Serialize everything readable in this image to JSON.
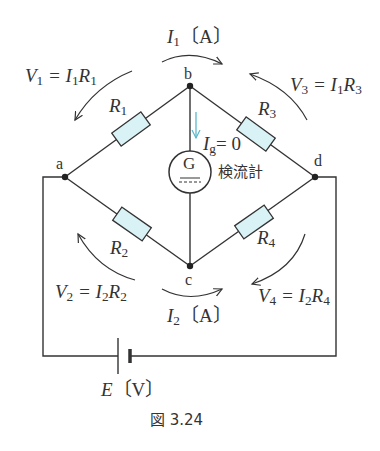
{
  "figure": {
    "caption": "図 3.24",
    "type": "Wheatstone bridge circuit"
  },
  "nodes": {
    "a": "a",
    "b": "b",
    "c": "c",
    "d": "d"
  },
  "resistors": [
    {
      "name": "R",
      "sub": "1"
    },
    {
      "name": "R",
      "sub": "2"
    },
    {
      "name": "R",
      "sub": "3"
    },
    {
      "name": "R",
      "sub": "4"
    }
  ],
  "currents": {
    "top": {
      "sym": "I",
      "sub": "1",
      "unit": "〔A〕"
    },
    "bottom": {
      "sym": "I",
      "sub": "2",
      "unit": "〔A〕"
    },
    "galvanometer": {
      "sym": "I",
      "sub": "g",
      "eq": "= 0"
    }
  },
  "voltages": [
    {
      "v": "V",
      "vs": "1",
      "i": "I",
      "is": "1",
      "r": "R",
      "rs": "1"
    },
    {
      "v": "V",
      "vs": "2",
      "i": "I",
      "is": "2",
      "r": "R",
      "rs": "2"
    },
    {
      "v": "V",
      "vs": "3",
      "i": "I",
      "is": "1",
      "r": "R",
      "rs": "3"
    },
    {
      "v": "V",
      "vs": "4",
      "i": "I",
      "is": "2",
      "r": "R",
      "rs": "4"
    }
  ],
  "galvanometer": {
    "symbol": "G",
    "label": "検流計"
  },
  "source": {
    "sym": "E",
    "unit": "〔V〕"
  },
  "colors": {
    "resistor_fill": "#d8f2f6",
    "ig_arrow": "#5bb8cc",
    "wire": "#333333"
  }
}
